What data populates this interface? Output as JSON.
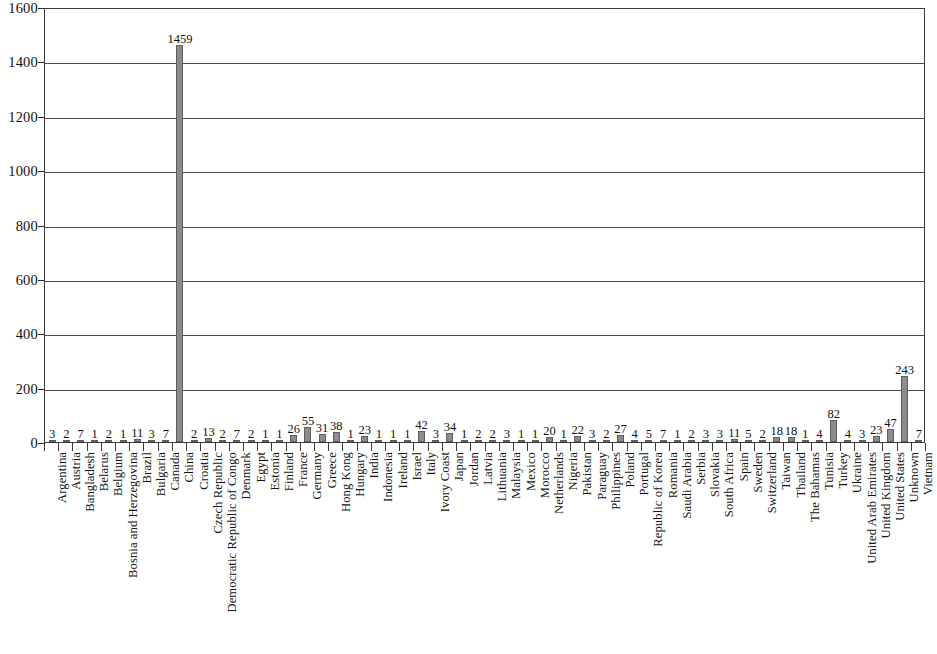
{
  "chart_data": {
    "type": "bar",
    "title": "",
    "subtitle": "",
    "xlabel": "",
    "ylabel": "",
    "ylim": [
      0,
      1600
    ],
    "y_ticks": [
      0,
      200,
      400,
      600,
      800,
      1000,
      1200,
      1400,
      1600
    ],
    "grid": true,
    "legend": "none",
    "orientation": "vertical",
    "bar_color": "#8c8c8c",
    "bar_edge_color": "#5f5f5f",
    "axis_color": "#3a3a3a",
    "value_labels_shown": true,
    "categories": [
      "Argentina",
      "Austria",
      "Bangladesh",
      "Belarus",
      "Belgium",
      "Bosnia and Herzegovina",
      "Brazil",
      "Bulgaria",
      "Canada",
      "China",
      "Croatia",
      "Czech Republic",
      "Democratic Republic of Congo",
      "Denmark",
      "Egypt",
      "Estonia",
      "Finland",
      "France",
      "Germany",
      "Greece",
      "Hong Kong",
      "Hungary",
      "India",
      "Indonesia",
      "Ireland",
      "Israel",
      "Italy",
      "Ivory Coast",
      "Japan",
      "Jordan",
      "Latvia",
      "Lithuania",
      "Malaysia",
      "Mexico",
      "Morocco",
      "Netherlands",
      "Nigeria",
      "Pakistan",
      "Paraguay",
      "Philippines",
      "Poland",
      "Portugal",
      "Republic of Korea",
      "Romania",
      "Saudi Arabia",
      "Serbia",
      "Slovakia",
      "South Africa",
      "Spain",
      "Sweden",
      "Switzerland",
      "Taiwan",
      "Thailand",
      "The Bahamas",
      "Tunisia",
      "Turkey",
      "Ukraine",
      "United Arab Emirates",
      "United Kingdom",
      "United States",
      "Unknown",
      "Vietnam"
    ],
    "values": [
      3,
      2,
      7,
      1,
      2,
      1,
      11,
      3,
      7,
      1459,
      2,
      13,
      2,
      7,
      2,
      1,
      1,
      26,
      55,
      31,
      38,
      1,
      23,
      1,
      1,
      1,
      42,
      3,
      34,
      1,
      2,
      2,
      3,
      1,
      1,
      20,
      1,
      22,
      3,
      2,
      27,
      4,
      5,
      7,
      1,
      2,
      3,
      3,
      11,
      5,
      2,
      18,
      18,
      1,
      4,
      82,
      4,
      3,
      23,
      47,
      243,
      7
    ]
  },
  "axis": {
    "y_tick_labels": [
      "0",
      "200",
      "400",
      "600",
      "800",
      "1000",
      "1200",
      "1400",
      "1600"
    ]
  }
}
